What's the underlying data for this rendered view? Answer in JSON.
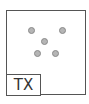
{
  "tile": {
    "label": "TX",
    "dots": [
      {
        "x": 28,
        "y": 27
      },
      {
        "x": 59,
        "y": 27
      },
      {
        "x": 41,
        "y": 38
      },
      {
        "x": 34,
        "y": 50
      },
      {
        "x": 52,
        "y": 50
      }
    ],
    "colors": {
      "border": "#555555",
      "dot_fill": "#b5b5b5",
      "dot_border": "#8a8a8a",
      "text": "#333333"
    }
  }
}
